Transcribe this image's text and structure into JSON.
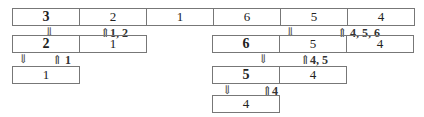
{
  "diagram": {
    "type": "merge-sort-split-tree",
    "level0": {
      "cells": [
        "3",
        "2",
        "1",
        "6",
        "5",
        "4"
      ],
      "bold_index": 0
    },
    "level1_left": {
      "cells": [
        "2",
        "1"
      ],
      "bold_index": 0
    },
    "level1_right": {
      "cells": [
        "6",
        "5",
        "4"
      ],
      "bold_index": 0
    },
    "level2_left": {
      "cells": [
        "1"
      ]
    },
    "level2_right": {
      "cells": [
        "5",
        "4"
      ],
      "bold_index": 0
    },
    "level3_right": {
      "cells": [
        "4"
      ]
    },
    "arrows": {
      "down": "⇓",
      "up": "⇑"
    },
    "labels": {
      "up_1_2": "1, 2",
      "up_4_5_6": "4, 5, 6",
      "up_1": "1",
      "up_4_5": "4, 5",
      "up_4": "4"
    }
  }
}
